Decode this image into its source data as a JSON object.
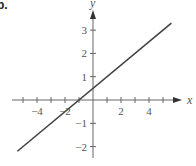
{
  "part_label": "b.",
  "chart_data": {
    "type": "line",
    "title": "",
    "xlabel": "x",
    "ylabel": "y",
    "equation_estimate": "y = 0.5x + 0.5",
    "xlim": [
      -5.4,
      5.6
    ],
    "ylim": [
      -2.3,
      3.3
    ],
    "grid": false,
    "legend": null,
    "x_ticks": [
      -5,
      -4,
      -3,
      -2,
      -1,
      1,
      2,
      3,
      4,
      5
    ],
    "x_tick_labels": [
      {
        "value": -4,
        "label": "-4"
      },
      {
        "value": -2,
        "label": "-2"
      },
      {
        "value": 2,
        "label": "2"
      },
      {
        "value": 4,
        "label": "4"
      }
    ],
    "y_ticks": [
      -2,
      -1,
      1,
      2,
      3
    ],
    "y_tick_labels": [
      {
        "value": 3,
        "label": "3"
      },
      {
        "value": 2,
        "label": "2"
      },
      {
        "value": 1,
        "label": "1"
      },
      {
        "value": -1,
        "label": "-1"
      },
      {
        "value": -2,
        "label": "-2"
      }
    ],
    "series": [
      {
        "name": "line",
        "x": [
          -5.4,
          5.6
        ],
        "y": [
          -2.2,
          3.3
        ],
        "color": "#444444"
      }
    ]
  },
  "colors": {
    "axis": "#666666",
    "line": "#444444",
    "text": "#555555"
  }
}
